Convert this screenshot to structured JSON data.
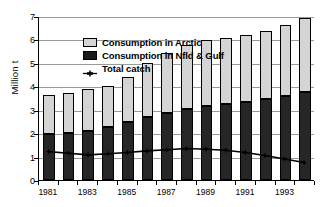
{
  "chart_data": {
    "type": "bar",
    "title": "",
    "subtitle": "",
    "xlabel": "",
    "ylabel": "Million t",
    "ylim": [
      0,
      7
    ],
    "ytick_labels": [
      "0",
      "1",
      "2",
      "3",
      "4",
      "5",
      "6",
      "7"
    ],
    "grid": true,
    "legend_position": "top-left-inside",
    "stacked": true,
    "categories": [
      "1981",
      "1982",
      "1983",
      "1984",
      "1985",
      "1986",
      "1987",
      "1988",
      "1989",
      "1990",
      "1991",
      "1992",
      "1993",
      "1994"
    ],
    "xtick_labels_shown": [
      "1981",
      "1983",
      "1985",
      "1987",
      "1989",
      "1991",
      "1993"
    ],
    "series": [
      {
        "name": "Consumption in Nfld & Gulf",
        "type": "bar",
        "color": "#262626",
        "values": [
          1.95,
          2.0,
          2.08,
          2.25,
          2.47,
          2.67,
          2.88,
          3.05,
          3.17,
          3.25,
          3.33,
          3.45,
          3.57,
          3.75
        ]
      },
      {
        "name": "Consumption in Arctic",
        "type": "bar",
        "color": "#d4d4d4",
        "values": [
          1.67,
          1.7,
          1.79,
          1.78,
          1.93,
          2.31,
          2.55,
          2.7,
          2.81,
          2.83,
          2.85,
          2.93,
          3.03,
          3.15
        ]
      },
      {
        "name": "Total catch",
        "type": "line",
        "color": "#000000",
        "values": [
          1.22,
          1.15,
          1.08,
          1.13,
          1.18,
          1.25,
          1.3,
          1.35,
          1.32,
          1.28,
          1.18,
          1.05,
          0.9,
          0.75
        ]
      }
    ],
    "totals": [
      3.62,
      3.7,
      3.87,
      4.03,
      4.4,
      4.98,
      5.43,
      5.75,
      5.98,
      6.08,
      6.18,
      6.38,
      6.6,
      6.9
    ]
  },
  "legend": {
    "items": [
      {
        "label": "Consumption in Arctic",
        "key": "swatch-light"
      },
      {
        "label": "Consumption in Nfld & Gulf",
        "key": "swatch-dark"
      },
      {
        "label": "Total catch",
        "key": "line-marker"
      }
    ]
  },
  "axes": {
    "y_title": "Million t"
  },
  "colors": {
    "arctic": "#d4d4d4",
    "nfld": "#262626",
    "line": "#000000",
    "grid": "#9a9a9a",
    "axis": "#000000"
  }
}
